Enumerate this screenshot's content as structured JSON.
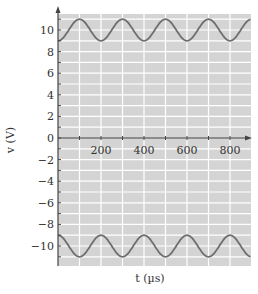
{
  "chart_data": {
    "type": "line",
    "title": "",
    "xlabel": "t (µs)",
    "ylabel": "v (V)",
    "xlim": [
      0,
      900
    ],
    "ylim": [
      -12,
      11.5
    ],
    "grid": true,
    "x_ticks": [
      200,
      400,
      600,
      800
    ],
    "x_tick_labels": [
      "200",
      "400",
      "600",
      "800"
    ],
    "y_ticks": [
      10,
      8,
      6,
      4,
      2,
      0,
      -2,
      -4,
      -6,
      -8,
      -10
    ],
    "y_tick_labels": [
      "10",
      "8",
      "6",
      "4",
      "2",
      "0",
      "−2",
      "−4",
      "−6",
      "−8",
      "−10"
    ],
    "series": [
      {
        "name": "upper waveform",
        "description": "v = 10 − cos(2πt/200)",
        "offset": 10,
        "amplitude": 1,
        "period_us": 200,
        "x": [
          0,
          50,
          100,
          150,
          200,
          250,
          300,
          350,
          400,
          450,
          500,
          550,
          600,
          650,
          700,
          750,
          800,
          850,
          900
        ],
        "values": [
          9,
          10,
          11,
          10,
          9,
          10,
          11,
          10,
          9,
          10,
          11,
          10,
          9,
          10,
          11,
          10,
          9,
          10,
          11
        ]
      },
      {
        "name": "lower waveform",
        "description": "v = −10 + cos(2πt/200)",
        "offset": -10,
        "amplitude": 1,
        "period_us": 200,
        "x": [
          0,
          50,
          100,
          150,
          200,
          250,
          300,
          350,
          400,
          450,
          500,
          550,
          600,
          650,
          700,
          750,
          800,
          850,
          900
        ],
        "values": [
          -9,
          -10,
          -11,
          -10,
          -9,
          -10,
          -11,
          -10,
          -9,
          -10,
          -11,
          -10,
          -9,
          -10,
          -11,
          -10,
          -9,
          -10,
          -11
        ]
      }
    ]
  },
  "colors": {
    "plot_background": "#d4d4d4",
    "grid": "#ffffff",
    "axis": "#444444",
    "curve": "#6e6e6e"
  }
}
